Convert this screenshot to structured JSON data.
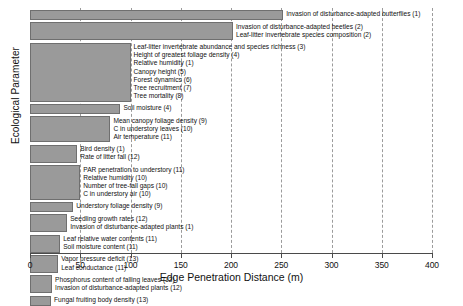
{
  "chart_data": {
    "type": "bar",
    "orientation": "horizontal",
    "title": "",
    "xlabel": "Edge Penetration Distance (m)",
    "ylabel": "Ecological Parameter",
    "xlim": [
      0,
      400
    ],
    "xticks": [
      0,
      50,
      100,
      150,
      200,
      250,
      300,
      350,
      400
    ],
    "grid": "vertical-dashed",
    "legend": "none",
    "bar_color": "#9a9a9a",
    "bar_edge_color": "#6f6f6f",
    "bars": [
      {
        "value": 252,
        "labels": [
          "Invasion of disturbance-adapted butterflies (1)"
        ]
      },
      {
        "value": 202,
        "labels": [
          "Invasion of disturbance-adapted beetles (2)",
          "Leaf-litter invertebrate species composition (2)"
        ]
      },
      {
        "value": 100,
        "labels": [
          "Leaf-litter invertebrate abundance and species richness (3)",
          "Height of greatest foliage density (4)",
          "Relative humidity (1)",
          "Canopy height (5)",
          "Forest dynamics (6)",
          "Tree recruitment (7)",
          "Tree mortality (8)"
        ]
      },
      {
        "value": 90,
        "labels": [
          "Soil moisture (4)"
        ]
      },
      {
        "value": 80,
        "labels": [
          "Mean canopy foliage density (9)",
          "C in understory leaves (10)",
          "Air temperature (11)"
        ]
      },
      {
        "value": 47,
        "labels": [
          "Bird density (1)",
          "Rate of litter fall (12)"
        ]
      },
      {
        "value": 50,
        "labels": [
          "PAR penetration to understory (11)",
          "Relative humidity (10)",
          "Number of tree-fall gaps (10)",
          "C in understory air (10)"
        ]
      },
      {
        "value": 43,
        "labels": [
          "Understory foliage density (9)"
        ]
      },
      {
        "value": 37,
        "labels": [
          "Seedling growth rates (12)",
          "Invasion of disturbance-adapted plants (1)"
        ]
      },
      {
        "value": 30,
        "labels": [
          "Leaf relative water contents (11)",
          "Soil moisture content (11)"
        ]
      },
      {
        "value": 28,
        "labels": [
          "Vapor pressure deficit (13)",
          "Leaf conductance (11)"
        ]
      },
      {
        "value": 22,
        "labels": [
          "Phosphorus content of falling leaves (12)",
          "Invasion of disturbance-adapted plants (12)"
        ]
      },
      {
        "value": 21,
        "labels": [
          "Fungal fruiting body density (13)"
        ]
      }
    ]
  }
}
